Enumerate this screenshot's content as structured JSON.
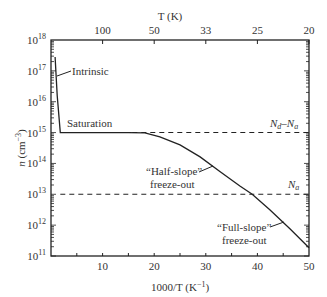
{
  "chart_data": {
    "type": "line",
    "title": "",
    "xlabel": "1000/T (K⁻¹)",
    "ylabel": "n (cm⁻³)",
    "top_xlabel": "T (K)",
    "xlim": [
      0,
      50
    ],
    "ylim_log10": [
      11,
      18
    ],
    "x_ticks": [
      10,
      20,
      30,
      40,
      50
    ],
    "x_tick_labels": [
      "10",
      "20",
      "30",
      "40",
      "50"
    ],
    "top_ticks": [
      {
        "x": 10,
        "label": "100"
      },
      {
        "x": 20,
        "label": "50"
      },
      {
        "x": 30,
        "label": "33"
      },
      {
        "x": 40,
        "label": "25"
      },
      {
        "x": 50,
        "label": "20"
      }
    ],
    "y_ticks_log10": [
      11,
      12,
      13,
      14,
      15,
      16,
      17,
      18
    ],
    "y_tick_labels": [
      "10",
      "10",
      "10",
      "10",
      "10",
      "10",
      "10",
      "10"
    ],
    "y_tick_exps": [
      "11",
      "12",
      "13",
      "14",
      "15",
      "16",
      "17",
      "18"
    ],
    "grid": false,
    "series": [
      {
        "name": "n",
        "x": [
          0.8,
          1.2,
          1.8,
          5,
          10,
          15,
          18.2,
          21.1,
          25.0,
          28.9,
          32.8,
          36.6,
          39.0,
          42.4,
          46.3,
          50
        ],
        "log10_y": [
          17.45,
          16.2,
          15.0,
          15.0,
          15.0,
          15.0,
          14.99,
          14.86,
          14.6,
          14.21,
          13.73,
          13.27,
          13.0,
          12.5,
          11.88,
          11.27
        ]
      }
    ],
    "reference_lines": [
      {
        "name": "Nd-Na",
        "log10_y": 15,
        "style": "dashed"
      },
      {
        "name": "Na",
        "log10_y": 13,
        "style": "dashed"
      }
    ],
    "annotations": [
      {
        "text": "Intrinsic",
        "x": 6,
        "log10_y": 17.0
      },
      {
        "text": "Saturation",
        "x": 9,
        "log10_y": 15.15
      },
      {
        "text": "“Half-slope”",
        "line2": "freeze-out",
        "x": 25,
        "log10_y": 14.0
      },
      {
        "text": "“Full-slope”",
        "line2": "freeze-out",
        "x": 39,
        "log10_y": 12.0
      },
      {
        "text": "Nd–Na",
        "x": 45,
        "log10_y": 15.2
      },
      {
        "text": "Na",
        "x": 48,
        "log10_y": 13.2
      }
    ]
  },
  "labels": {
    "intrinsic": "Intrinsic",
    "saturation": "Saturation",
    "half1": "“Half-slope”",
    "half2": "freeze-out",
    "full1": "“Full-slope”",
    "full2": "freeze-out",
    "ylabel_n": "n",
    "ylabel_unit": " (cm",
    "ylabel_exp": "−3",
    "ylabel_close": ")",
    "xlabel": "1000/T (K",
    "xlabel_exp": "−1",
    "xlabel_close": ")",
    "toplabel": "T (K)",
    "nd": "N",
    "nd_sub": "d",
    "dash": "–N",
    "na_sub": "a",
    "na": "N",
    "na_sub2": "a"
  }
}
